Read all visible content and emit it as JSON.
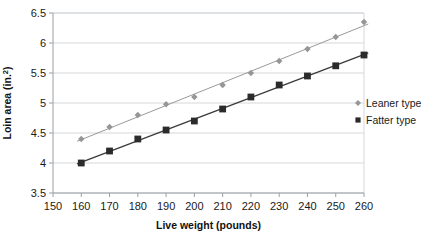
{
  "chart_data": {
    "type": "scatter",
    "title": "",
    "xlabel": "Live weight (pounds)",
    "ylabel": "Loin area (in.2)",
    "ylabel_base": "Loin area (in.",
    "ylabel_sup": "2",
    "ylabel_tail": ")",
    "x": [
      160,
      170,
      180,
      190,
      200,
      210,
      220,
      230,
      240,
      250,
      260
    ],
    "xlim": [
      150,
      260
    ],
    "ylim": [
      3.5,
      6.5
    ],
    "xticks": [
      150,
      160,
      170,
      180,
      190,
      200,
      210,
      220,
      230,
      240,
      250,
      260
    ],
    "xtick_labels": [
      "150",
      "160",
      "170",
      "180",
      "190",
      "200",
      "210",
      "220",
      "230",
      "240",
      "250",
      "260"
    ],
    "yticks": [
      3.5,
      4,
      4.5,
      5,
      5.5,
      6,
      6.5
    ],
    "ytick_labels": [
      "3.5",
      "4",
      "4.5",
      "5",
      "5.5",
      "6",
      "6.5"
    ],
    "grid": "horizontal",
    "legend_position": "right",
    "series": [
      {
        "name": "Leaner type",
        "marker": "diamond",
        "color": "#969696",
        "line_color": "#9a9a9a",
        "trendline": true,
        "values": [
          4.4,
          4.6,
          4.8,
          4.98,
          5.1,
          5.3,
          5.5,
          5.7,
          5.9,
          6.1,
          6.35
        ]
      },
      {
        "name": "Fatter type",
        "marker": "square",
        "color": "#2b2b2b",
        "line_color": "#3a3a3a",
        "trendline": true,
        "values": [
          4.0,
          4.2,
          4.4,
          4.55,
          4.7,
          4.9,
          5.1,
          5.3,
          5.45,
          5.62,
          5.8
        ]
      }
    ],
    "colors": {
      "plot_border": "#9aa0a6",
      "gridline": "#d4d7da",
      "background": "#ffffff",
      "text": "#1a1a1a"
    }
  },
  "legend": {
    "items": [
      {
        "label": "Leaner type",
        "marker": "diamond-marker-icon"
      },
      {
        "label": "Fatter type",
        "marker": "square-marker-icon"
      }
    ]
  }
}
